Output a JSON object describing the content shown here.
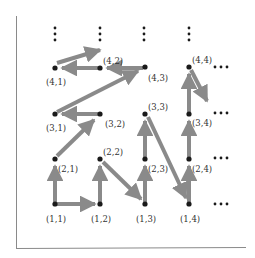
{
  "diagram": {
    "colors": {
      "arrow": "#8a8a8a",
      "node": "#1a1a1a",
      "frame": "#8a8a8a",
      "text": "#333333"
    },
    "nodes": [
      {
        "id": "1,1",
        "label": "(1,1)"
      },
      {
        "id": "1,2",
        "label": "(1,2)"
      },
      {
        "id": "1,3",
        "label": "(1,3)"
      },
      {
        "id": "1,4",
        "label": "(1,4)"
      },
      {
        "id": "2,1",
        "label": "(2,1)"
      },
      {
        "id": "2,2",
        "label": "(2,2)"
      },
      {
        "id": "2,3",
        "label": "(2,3)"
      },
      {
        "id": "2,4",
        "label": "(2,4)"
      },
      {
        "id": "3,1",
        "label": "(3,1)"
      },
      {
        "id": "3,2",
        "label": "(3,2)"
      },
      {
        "id": "3,3",
        "label": "(3,3)"
      },
      {
        "id": "3,4",
        "label": "(3,4)"
      },
      {
        "id": "4,1",
        "label": "(4,1)"
      },
      {
        "id": "4,2",
        "label": "(4,2)"
      },
      {
        "id": "4,3",
        "label": "(4,3)"
      },
      {
        "id": "4,4",
        "label": "(4,4)"
      }
    ],
    "edges": [
      {
        "from": "1,1",
        "to": "1,2"
      },
      {
        "from": "1,1",
        "to": "2,1"
      },
      {
        "from": "1,2",
        "to": "2,2"
      },
      {
        "from": "2,2",
        "to": "1,3"
      },
      {
        "from": "1,3",
        "to": "2,3"
      },
      {
        "from": "2,3",
        "to": "3,3"
      },
      {
        "from": "3,3",
        "to": "1,4"
      },
      {
        "from": "1,4",
        "to": "2,4"
      },
      {
        "from": "2,4",
        "to": "3,4"
      },
      {
        "from": "3,4",
        "to": "4,4"
      },
      {
        "from": "4,4",
        "to": "3,4 (partial)"
      },
      {
        "from": "2,1",
        "to": "3,2"
      },
      {
        "from": "3,2",
        "to": "3,1"
      },
      {
        "from": "3,1",
        "to": "4,3"
      },
      {
        "from": "4,3",
        "to": "4,2"
      },
      {
        "from": "4,2",
        "to": "4,1"
      },
      {
        "from": "4,1",
        "to": "above 4,2"
      }
    ],
    "ellipsis_vertical": "⋮",
    "ellipsis_horizontal": "···"
  }
}
